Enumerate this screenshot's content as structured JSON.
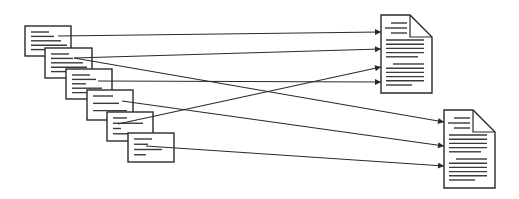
{
  "diagram": {
    "colors": {
      "stroke": "#2a2a2a",
      "text_line": "#3a3a3a",
      "background": "#ffffff"
    },
    "cards": [
      {
        "id": "card-1",
        "x": 25,
        "y": 26,
        "w": 46,
        "h": 30,
        "lines": [
          [
            6,
            18
          ],
          [
            6,
            23
          ],
          [
            6,
            30
          ],
          [
            6,
            36
          ],
          [
            6,
            32
          ]
        ]
      },
      {
        "id": "card-2",
        "x": 45,
        "y": 48,
        "w": 47,
        "h": 30,
        "lines": [
          [
            6,
            18
          ],
          [
            6,
            22
          ],
          [
            6,
            32
          ],
          [
            6,
            36
          ],
          [
            6,
            30
          ]
        ]
      },
      {
        "id": "card-3",
        "x": 66,
        "y": 69,
        "w": 46,
        "h": 30,
        "lines": [
          [
            6,
            18
          ],
          [
            6,
            24
          ],
          [
            6,
            14
          ],
          [
            6,
            30
          ],
          [
            6,
            34
          ]
        ]
      },
      {
        "id": "card-4",
        "x": 87,
        "y": 90,
        "w": 46,
        "h": 30,
        "lines": [
          [
            6,
            20
          ],
          [
            6,
            26
          ],
          [
            6,
            34
          ]
        ]
      },
      {
        "id": "card-5",
        "x": 107,
        "y": 112,
        "w": 46,
        "h": 29,
        "lines": [
          [
            6,
            14
          ],
          [
            6,
            30
          ],
          [
            6,
            8
          ],
          [
            6,
            20
          ]
        ]
      },
      {
        "id": "card-6",
        "x": 128,
        "y": 133,
        "w": 46,
        "h": 29,
        "lines": [
          [
            6,
            18
          ],
          [
            6,
            14
          ],
          [
            6,
            28
          ],
          [
            6,
            12
          ]
        ]
      }
    ],
    "documents": [
      {
        "id": "document-1",
        "x": 381,
        "y": 15,
        "w": 51,
        "h": 78,
        "fold": 22
      },
      {
        "id": "document-2",
        "x": 444,
        "y": 110,
        "w": 51,
        "h": 78,
        "fold": 22
      }
    ],
    "arrows": [
      {
        "from": "card-1",
        "x1": 58,
        "y1": 36,
        "to": "document-1",
        "x2": 381,
        "y2": 32
      },
      {
        "from": "card-2",
        "x1": 74,
        "y1": 58,
        "to": "document-1",
        "x2": 381,
        "y2": 49
      },
      {
        "from": "card-3",
        "x1": 98,
        "y1": 81,
        "to": "document-1",
        "x2": 381,
        "y2": 82
      },
      {
        "from": "card-5",
        "x1": 118,
        "y1": 124,
        "to": "document-1",
        "x2": 381,
        "y2": 67
      },
      {
        "from": "card-2",
        "x1": 74,
        "y1": 58,
        "to": "document-2",
        "x2": 444,
        "y2": 122
      },
      {
        "from": "card-4",
        "x1": 122,
        "y1": 101,
        "to": "document-2",
        "x2": 444,
        "y2": 146
      },
      {
        "from": "card-6",
        "x1": 146,
        "y1": 146,
        "to": "document-2",
        "x2": 444,
        "y2": 166
      }
    ]
  }
}
